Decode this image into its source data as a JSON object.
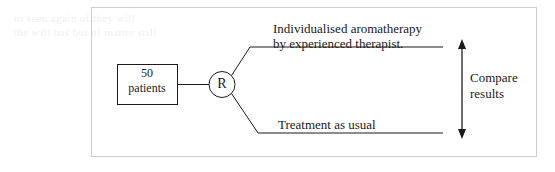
{
  "figure": {
    "type": "randomised-controlled-trial-flow-diagram",
    "ghost_text": "to seen again of they will\nthe will has but of matter still",
    "frame": {
      "border_color": "#cdcdcd",
      "background": "#ffffff"
    },
    "ink_color": "#1b1b1b",
    "population_box": {
      "label": "50\npatients",
      "count": "50",
      "unit": "patients"
    },
    "randomisation_node": {
      "label": "R",
      "meaning": "randomisation"
    },
    "arms": [
      {
        "id": "intervention",
        "label": "Individualised aromatherapy\nby experienced therapist.",
        "position": "top"
      },
      {
        "id": "control",
        "label": "Treatment as usual",
        "position": "bottom"
      }
    ],
    "comparison": {
      "label": "Compare\nresults",
      "arrow": "double-headed-vertical"
    }
  }
}
